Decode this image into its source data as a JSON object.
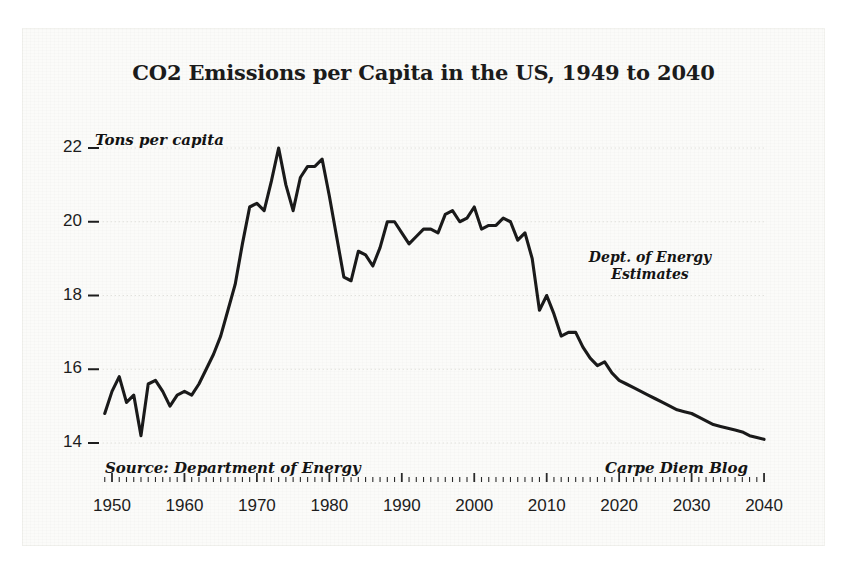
{
  "chart_data": {
    "type": "line",
    "title": "CO2 Emissions per Capita in the US, 1949 to 2040",
    "xlabel": "",
    "ylabel": "Tons per capita",
    "xlim": [
      1949,
      2040
    ],
    "ylim": [
      13.6,
      22.4
    ],
    "grid": true,
    "legend": "none",
    "y_ticks": [
      22,
      20,
      18,
      16,
      14
    ],
    "y_tick_labels": [
      "22",
      "20",
      "18",
      "16",
      "14"
    ],
    "x_ticks": [
      1950,
      1960,
      1970,
      1980,
      1990,
      2000,
      2010,
      2020,
      2030,
      2040
    ],
    "x_tick_labels": [
      "1950",
      "1960",
      "1970",
      "1980",
      "1990",
      "2000",
      "2010",
      "2020",
      "2030",
      "2040"
    ],
    "x_minor_tick_interval": 1,
    "annotations": [
      {
        "text": "Dept. of Energy",
        "x": 2022,
        "y": 19.1
      },
      {
        "text": "Estimates",
        "x": 2022,
        "y": 18.8
      },
      {
        "text": "Source: Department of Energy",
        "x": 1952,
        "y": 13.3
      },
      {
        "text": "Carpe Diem Blog",
        "x": 2030,
        "y": 13.3
      }
    ],
    "series": [
      {
        "name": "CO2 emissions per capita (tons)",
        "color": "#1a1a1a",
        "x": [
          1949,
          1950,
          1951,
          1952,
          1953,
          1954,
          1955,
          1956,
          1957,
          1958,
          1959,
          1960,
          1961,
          1962,
          1963,
          1964,
          1965,
          1966,
          1967,
          1968,
          1969,
          1970,
          1971,
          1972,
          1973,
          1974,
          1975,
          1976,
          1977,
          1978,
          1979,
          1980,
          1981,
          1982,
          1983,
          1984,
          1985,
          1986,
          1987,
          1988,
          1989,
          1990,
          1991,
          1992,
          1993,
          1994,
          1995,
          1996,
          1997,
          1998,
          1999,
          2000,
          2001,
          2002,
          2003,
          2004,
          2005,
          2006,
          2007,
          2008,
          2009,
          2010,
          2011,
          2012,
          2013,
          2014,
          2015,
          2016,
          2017,
          2018,
          2019,
          2020,
          2021,
          2022,
          2023,
          2024,
          2025,
          2026,
          2027,
          2028,
          2029,
          2030,
          2031,
          2032,
          2033,
          2034,
          2035,
          2036,
          2037,
          2038,
          2039,
          2040
        ],
        "y": [
          14.8,
          15.4,
          15.8,
          15.1,
          15.3,
          14.2,
          15.6,
          15.7,
          15.4,
          15.0,
          15.3,
          15.4,
          15.3,
          15.6,
          16.0,
          16.4,
          16.9,
          17.6,
          18.3,
          19.4,
          20.4,
          20.5,
          20.3,
          21.1,
          22.0,
          21.0,
          20.3,
          21.2,
          21.5,
          21.5,
          21.7,
          20.7,
          19.6,
          18.5,
          18.4,
          19.2,
          19.1,
          18.8,
          19.3,
          20.0,
          20.0,
          19.7,
          19.4,
          19.6,
          19.8,
          19.8,
          19.7,
          20.2,
          20.3,
          20.0,
          20.1,
          20.4,
          19.8,
          19.9,
          19.9,
          20.1,
          20.0,
          19.5,
          19.7,
          19.0,
          17.6,
          18.0,
          17.5,
          16.9,
          17.0,
          17.0,
          16.6,
          16.3,
          16.1,
          16.2,
          15.9,
          15.7,
          15.6,
          15.5,
          15.4,
          15.3,
          15.2,
          15.1,
          15.0,
          14.9,
          14.85,
          14.8,
          14.7,
          14.6,
          14.5,
          14.45,
          14.4,
          14.35,
          14.3,
          14.2,
          14.15,
          14.1
        ]
      }
    ]
  },
  "footer": {
    "source": "Source: Department of Energy",
    "credit": "Carpe Diem Blog"
  },
  "annotation_block": {
    "line1": "Dept. of Energy",
    "line2": "Estimates"
  }
}
